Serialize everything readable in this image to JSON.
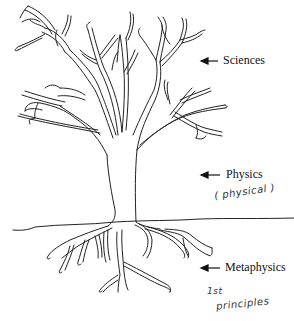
{
  "diagram": {
    "type": "tree metaphor",
    "labels": [
      {
        "id": "sciences",
        "text": "Sciences",
        "points_to": "branches"
      },
      {
        "id": "physics",
        "text": "Physics",
        "points_to": "trunk"
      },
      {
        "id": "metaphysics",
        "text": "Metaphysics",
        "points_to": "roots"
      }
    ],
    "annotations": [
      {
        "id": "physical",
        "text": "( physical )",
        "style": "handwritten"
      },
      {
        "id": "first_principles_sup",
        "text": "1st",
        "style": "handwritten"
      },
      {
        "id": "first_principles",
        "text": "principles",
        "style": "handwritten"
      }
    ]
  }
}
